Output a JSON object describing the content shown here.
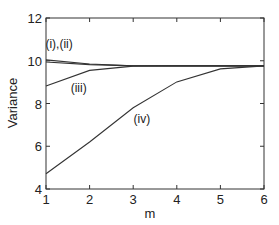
{
  "chart_data": {
    "type": "line",
    "title": "",
    "xlabel": "m",
    "ylabel": "Variance",
    "xlim": [
      1,
      6
    ],
    "ylim": [
      4,
      12
    ],
    "xticks": [
      1,
      2,
      3,
      4,
      5,
      6
    ],
    "yticks": [
      4,
      6,
      8,
      10,
      12
    ],
    "grid": false,
    "legend": "none (inline annotations)",
    "x": [
      1,
      2,
      3,
      4,
      5,
      6
    ],
    "series": [
      {
        "name": "(i)",
        "values": [
          10.04,
          9.85,
          9.77,
          9.76,
          9.76,
          9.76
        ]
      },
      {
        "name": "(ii)",
        "values": [
          9.94,
          9.82,
          9.76,
          9.76,
          9.76,
          9.76
        ]
      },
      {
        "name": "(iii)",
        "values": [
          8.82,
          9.55,
          9.75,
          9.76,
          9.76,
          9.76
        ]
      },
      {
        "name": "(iv)",
        "values": [
          4.71,
          6.2,
          7.8,
          9.01,
          9.62,
          9.76
        ]
      }
    ],
    "annotations": [
      {
        "text": "(i),(ii)",
        "x": 1.3,
        "y": 10.6
      },
      {
        "text": "(iii)",
        "x": 1.75,
        "y": 8.55
      },
      {
        "text": "(iv)",
        "x": 3.2,
        "y": 7.1
      }
    ],
    "line_color": "#333333"
  }
}
